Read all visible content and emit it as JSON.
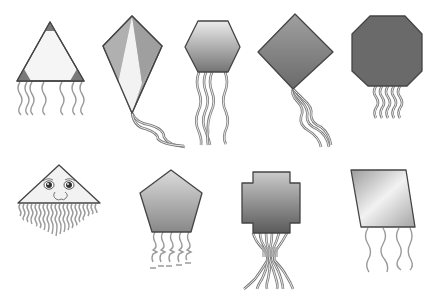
{
  "scene": {
    "description": "Collection of nine clip-art kites of different shapes on white background",
    "background": "#ffffff",
    "kites": [
      {
        "id": "triangle-kite",
        "shape": "triangle",
        "fill": "#f5f5f5",
        "accent": "#7a7a7a",
        "tail_count": 7
      },
      {
        "id": "diamond-kite",
        "shape": "classic diamond kite",
        "fill": "#a8a8a8",
        "accent": "#f0f0f0",
        "tail_count": 2
      },
      {
        "id": "hexagon-kite",
        "shape": "hexagon",
        "fill_top": "#e8e8e8",
        "fill_bottom": "#7a7a7a",
        "tail_count": 5
      },
      {
        "id": "square-diamond-kite",
        "shape": "rotated square",
        "fill_top": "#9a9a9a",
        "fill_bottom": "#6e6e6e",
        "tail_count": 3
      },
      {
        "id": "octagon-kite",
        "shape": "octagon",
        "fill": "#6a6a6a",
        "tail_count": 6
      },
      {
        "id": "face-triangle-kite",
        "shape": "triangle with face",
        "fill": "#f2f2f2",
        "tail_count": 18
      },
      {
        "id": "pentagon-kite",
        "shape": "pentagon",
        "fill_top": "#d4d4d4",
        "fill_bottom": "#8c8c8c",
        "tail_count": 5
      },
      {
        "id": "cross-kite",
        "shape": "cross / notched square",
        "fill_top": "#c4c4c4",
        "fill_bottom": "#5e5e5e",
        "tail_count": 8
      },
      {
        "id": "parallelogram-kite",
        "shape": "parallelogram",
        "fill": "#b8b8b8",
        "accent": "#efefef",
        "tail_count": 4
      }
    ]
  }
}
